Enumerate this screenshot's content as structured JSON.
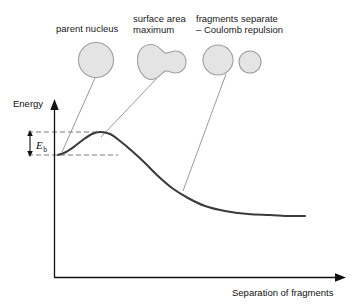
{
  "figure": {
    "type": "diagram",
    "background_color": "#ffffff",
    "curve_color": "#3b3b3b",
    "axis_color": "#111111",
    "nucleus_fill": "#e3e3e3",
    "nucleus_stroke": "#9a9a9a",
    "leader_color": "#8d8d8d",
    "dashed_color": "#777777"
  },
  "axes": {
    "y_label": "Energy",
    "x_label": "Separation of fragments",
    "origin": {
      "x": 54,
      "y": 277
    },
    "y_top": {
      "x": 54,
      "y": 100
    },
    "x_right": {
      "x": 346,
      "y": 277
    },
    "grid": "off",
    "ticks": "none"
  },
  "annotations": {
    "barrier": {
      "label": "E",
      "subscript": "b",
      "meaning": "activation energy barrier",
      "top_level_y": 132,
      "base_level_y": 155
    },
    "callouts": [
      {
        "id": "parent-nucleus",
        "lines": [
          "parent nucleus"
        ],
        "shape": "circle",
        "leader_from": {
          "x": 95,
          "y": 78
        },
        "leader_to": {
          "x": 62,
          "y": 152
        }
      },
      {
        "id": "surface-area-maximum",
        "lines": [
          "surface area",
          "maximum"
        ],
        "shape": "dumbbell",
        "leader_from": {
          "x": 160,
          "y": 75
        },
        "leader_to": {
          "x": 101,
          "y": 136
        }
      },
      {
        "id": "fragments-separate",
        "lines": [
          "fragments separate",
          "– Coulomb repulsion"
        ],
        "shape": "two-circles",
        "leader_from": {
          "x": 226,
          "y": 74
        },
        "leader_to": {
          "x": 183,
          "y": 191
        }
      }
    ]
  },
  "chart_data": {
    "type": "line",
    "title": "",
    "xlabel": "Separation of fragments",
    "ylabel": "Energy",
    "grid": false,
    "legend": "none",
    "series": [
      {
        "name": "potential energy curve",
        "points": [
          [
            58,
            155
          ],
          [
            66,
            152
          ],
          [
            75,
            146
          ],
          [
            84,
            139
          ],
          [
            92,
            134
          ],
          [
            100,
            132
          ],
          [
            110,
            134
          ],
          [
            120,
            141
          ],
          [
            132,
            151
          ],
          [
            145,
            163
          ],
          [
            158,
            176
          ],
          [
            172,
            188
          ],
          [
            188,
            198
          ],
          [
            205,
            206
          ],
          [
            225,
            211
          ],
          [
            248,
            214
          ],
          [
            270,
            215
          ],
          [
            290,
            216
          ],
          [
            305,
            216
          ]
        ]
      }
    ],
    "features": {
      "start_value": 155,
      "peak_value": 132,
      "peak_x": 100,
      "asymptote_value": 216,
      "barrier_height_px": 23
    }
  }
}
